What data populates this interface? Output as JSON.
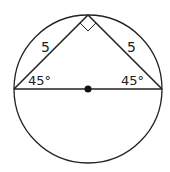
{
  "diagram": {
    "labels": {
      "left_side": "5",
      "right_side": "5",
      "left_angle": "45°",
      "right_angle": "45°"
    },
    "colors": {
      "stroke": "#222222",
      "background": "#ffffff"
    }
  }
}
